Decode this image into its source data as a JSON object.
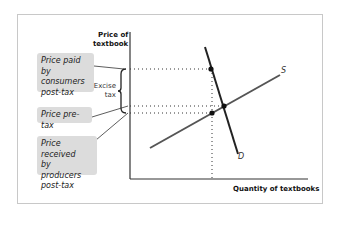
{
  "diagram": {
    "y_axis_label": [
      "Price of",
      "textbook"
    ],
    "x_axis_label": "Quantity of textbooks",
    "curves": {
      "supply": "S",
      "demand": "D"
    },
    "labels": {
      "price_consumers": [
        "Price paid by",
        "consumers",
        "post-tax"
      ],
      "price_pretax": "Price pre-tax",
      "price_producers": [
        "Price received",
        "by producers",
        "post-tax"
      ],
      "excise_tax": [
        "Excise",
        "tax"
      ]
    },
    "colors": {
      "label_bg": "#dcdcdc",
      "demand_line": "#222222",
      "supply_line": "#555555",
      "axis": "#333333",
      "frame": "#c8c8c8"
    }
  }
}
